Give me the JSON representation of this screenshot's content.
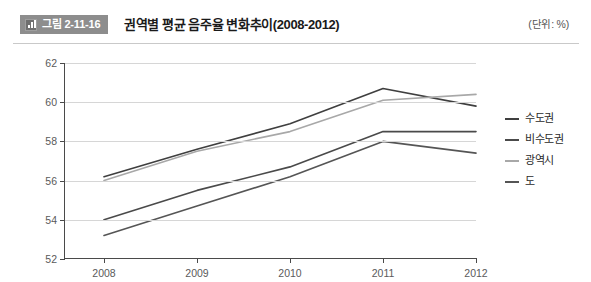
{
  "header": {
    "badge_label": "그림 2-11-16",
    "badge_icon": "bar-chart-icon",
    "badge_bg": "#8d8d8d",
    "title": "권역별 평균 음주율 변화추이(2008-2012)",
    "unit": "(단위: %)"
  },
  "chart_data": {
    "type": "line",
    "title": "권역별 평균 음주율 변화추이(2008-2012)",
    "xlabel": "",
    "ylabel": "",
    "unit": "%",
    "categories": [
      "2008",
      "2009",
      "2010",
      "2011",
      "2012"
    ],
    "x": [
      2008,
      2009,
      2010,
      2011,
      2012
    ],
    "ylim": [
      52,
      62
    ],
    "yticks": [
      52,
      54,
      56,
      58,
      60,
      62
    ],
    "ytick_labels": [
      "52",
      "54",
      "56",
      "58",
      "60",
      "62"
    ],
    "grid": true,
    "grid_axis": "y",
    "legend_position": "right",
    "series": [
      {
        "name": "수도권",
        "color": "#3f3f3f",
        "values": [
          56.2,
          57.6,
          58.9,
          60.7,
          59.8
        ]
      },
      {
        "name": "비수도권",
        "color": "#4a4a4a",
        "values": [
          54.0,
          55.5,
          56.7,
          58.5,
          58.5
        ]
      },
      {
        "name": "광역시",
        "color": "#a8a8a8",
        "values": [
          56.0,
          57.5,
          58.5,
          60.1,
          60.4
        ]
      },
      {
        "name": "도",
        "color": "#555555",
        "values": [
          53.2,
          54.7,
          56.2,
          58.0,
          57.4
        ]
      }
    ]
  },
  "legend": {
    "items": [
      {
        "label": "수도권",
        "color": "#3f3f3f"
      },
      {
        "label": "비수도권",
        "color": "#4a4a4a"
      },
      {
        "label": "광역시",
        "color": "#a8a8a8"
      },
      {
        "label": "도",
        "color": "#555555"
      }
    ]
  }
}
